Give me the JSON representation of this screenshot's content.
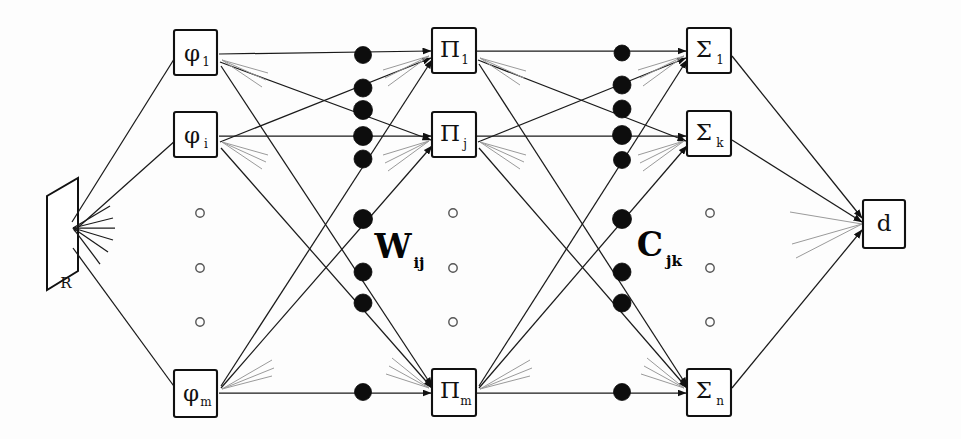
{
  "figure": {
    "background_color": "#fdfdfd",
    "ink_color": "#111111",
    "faint_ink_color": "#9a9a9a"
  },
  "input_plane": {
    "name": "retina-plane",
    "label": "R"
  },
  "layers": [
    {
      "id": "phi-layer",
      "name": "phi layer",
      "nodes": [
        {
          "id": "phi-1",
          "symbol": "φ",
          "subscript": "1",
          "x": 196,
          "y": 53
        },
        {
          "id": "phi-i",
          "symbol": "φ",
          "subscript": "i",
          "x": 196,
          "y": 135
        },
        {
          "id": "phi-m",
          "symbol": "φ",
          "subscript": "m",
          "x": 196,
          "y": 392
        }
      ],
      "ellipsis": {
        "x": 200,
        "ys": [
          213,
          268,
          322
        ]
      }
    },
    {
      "id": "pi-layer",
      "name": "pi layer",
      "nodes": [
        {
          "id": "pi-1",
          "symbol": "Π",
          "subscript": "1",
          "x": 454,
          "y": 51
        },
        {
          "id": "pi-j",
          "symbol": "Π",
          "subscript": "j",
          "x": 454,
          "y": 135
        },
        {
          "id": "pi-m",
          "symbol": "Π",
          "subscript": "m",
          "x": 454,
          "y": 392
        }
      ],
      "ellipsis": {
        "x": 453,
        "ys": [
          213,
          268,
          322
        ]
      }
    },
    {
      "id": "sigma-layer",
      "name": "sigma layer",
      "nodes": [
        {
          "id": "sigma-1",
          "symbol": "Σ",
          "subscript": "1",
          "x": 709,
          "y": 51
        },
        {
          "id": "sigma-k",
          "symbol": "Σ",
          "subscript": "k",
          "x": 709,
          "y": 134
        },
        {
          "id": "sigma-n",
          "symbol": "Σ",
          "subscript": "n",
          "x": 709,
          "y": 392
        }
      ],
      "ellipsis": {
        "x": 710,
        "ys": [
          213,
          268,
          322
        ]
      }
    },
    {
      "id": "output-layer",
      "name": "output layer",
      "nodes": [
        {
          "id": "output-d",
          "symbol": "d",
          "subscript": "",
          "x": 884,
          "y": 224
        }
      ],
      "ellipsis": null
    }
  ],
  "weight_labels": [
    {
      "id": "w-label",
      "symbol": "W",
      "subscript": "ij",
      "x": 397,
      "y": 250
    },
    {
      "id": "c-label",
      "symbol": "C",
      "subscript": "jk",
      "x": 653,
      "y": 248
    }
  ],
  "weight_dots": {
    "left_column_x": 363,
    "right_column_x": 622,
    "left_ys": [
      55,
      88,
      110,
      136,
      159,
      219,
      272,
      303,
      392
    ],
    "right_ys": [
      53,
      85,
      109,
      135,
      160,
      219,
      272,
      303,
      392
    ],
    "hatched_indices_left": [
      0
    ],
    "hatched_indices_right": [
      1,
      4
    ]
  },
  "box_geometry": {
    "width": 43,
    "height": 45,
    "output_width": 42,
    "output_height": 48
  }
}
